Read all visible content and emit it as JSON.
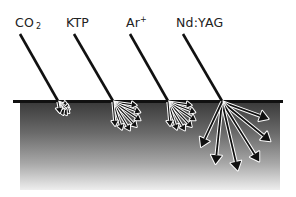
{
  "diagram": {
    "lasers": [
      {
        "id": "co2",
        "label_main": "CO",
        "label_sub": "2",
        "label_sup": "",
        "label_x": 15,
        "beam_start": [
          20,
          34
        ],
        "impact": [
          58,
          101
        ],
        "fan_count": 6,
        "fan_length": 14,
        "fan_spread": [
          20,
          80
        ],
        "arrow_style": "outline"
      },
      {
        "id": "ktp",
        "label_main": "KTP",
        "label_sub": "",
        "label_sup": "",
        "label_x": 66,
        "beam_start": [
          74,
          34
        ],
        "impact": [
          113,
          101
        ],
        "fan_count": 7,
        "fan_length": 30,
        "fan_spread": [
          8,
          85
        ],
        "arrow_style": "outline"
      },
      {
        "id": "ar",
        "label_main": "Ar",
        "label_sub": "",
        "label_sup": "+",
        "label_x": 126,
        "beam_start": [
          130,
          34
        ],
        "impact": [
          168,
          101
        ],
        "fan_count": 7,
        "fan_length": 30,
        "fan_spread": [
          8,
          85
        ],
        "arrow_style": "outline"
      },
      {
        "id": "ndyag",
        "label_main": "Nd:YAG",
        "label_sub": "",
        "label_sup": "",
        "label_x": 176,
        "beam_start": [
          183,
          34
        ],
        "impact": [
          222,
          101
        ],
        "fan_count": 6,
        "fan_length": 62,
        "fan_spread": [
          20,
          115
        ],
        "arrow_style": "solid"
      }
    ],
    "tissue": {
      "surface_y": 101,
      "surface_x_start": 13,
      "surface_x_end": 283,
      "block_x": 20,
      "block_width": 260,
      "block_top": 102,
      "block_bottom": 190,
      "gradient_top": "#3a3a3a",
      "gradient_bottom": "#eeeeee",
      "surface_color": "#111111"
    },
    "colors": {
      "beam": "#111111",
      "arrow_outline": "#ffffff",
      "label": "#222222"
    }
  }
}
